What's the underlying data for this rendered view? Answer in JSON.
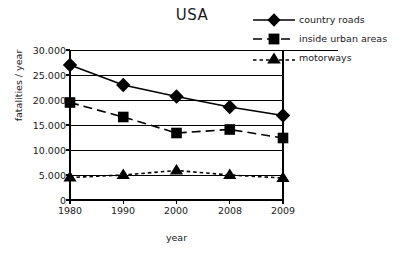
{
  "chart_data": {
    "type": "line",
    "title": "USA",
    "xlabel": "year",
    "ylabel": "fatalities / year",
    "categories": [
      "1980",
      "1990",
      "2000",
      "2008",
      "2009"
    ],
    "ylim": [
      0,
      30000
    ],
    "ytick_labels": [
      "30.000",
      "25.000",
      "20.000",
      "15.000",
      "10.000",
      "5.000",
      "0"
    ],
    "ytick_values": [
      30000,
      25000,
      20000,
      15000,
      10000,
      5000,
      0
    ],
    "grid": "horizontal",
    "legend_position": "top-right",
    "series": [
      {
        "name": "country roads",
        "marker": "diamond",
        "line_style": "solid",
        "color": "#000000",
        "values": [
          27000,
          23000,
          20700,
          18600,
          16900
        ]
      },
      {
        "name": "inside urban areas",
        "marker": "square",
        "line_style": "dashed",
        "color": "#000000",
        "values": [
          19500,
          16600,
          13400,
          14100,
          12400
        ]
      },
      {
        "name": "motorways",
        "marker": "triangle",
        "line_style": "dotted",
        "color": "#000000",
        "values": [
          4500,
          5000,
          5900,
          5000,
          4400
        ]
      }
    ]
  },
  "legend": {
    "items": [
      {
        "label": "country roads",
        "marker": "diamond-marker-icon",
        "line_style": "solid"
      },
      {
        "label": "inside urban areas",
        "marker": "square-marker-icon",
        "line_style": "dashed"
      },
      {
        "label": "motorways",
        "marker": "triangle-marker-icon",
        "line_style": "dotted"
      }
    ]
  },
  "axes": {
    "y_title": "fatalities / year",
    "x_title": "year",
    "y_ticks": [
      "30.000",
      "25.000",
      "20.000",
      "15.000",
      "10.000",
      "5.000",
      "0"
    ],
    "x_ticks": [
      "1980",
      "1990",
      "2000",
      "2008",
      "2009"
    ]
  }
}
